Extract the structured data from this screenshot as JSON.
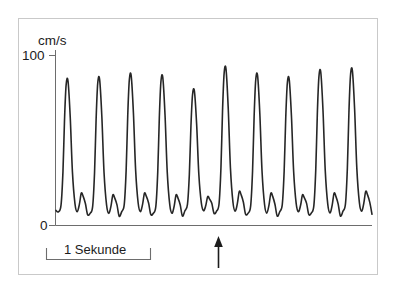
{
  "figure": {
    "name": "doppler-velocity-waveform",
    "background_color": "#ffffff",
    "frame_color": "#c9c9c9",
    "trace_color": "#262626",
    "axis_color": "#6d6d6d"
  },
  "labels": {
    "y_unit": "cm/s",
    "y_tick_top": "100",
    "y_tick_bottom": "0",
    "scale_bar": "1 Sekunde"
  },
  "chart_data": {
    "type": "line",
    "title": "",
    "subtitle": "",
    "xlabel": "",
    "ylabel": "cm/s",
    "grid": false,
    "legend": null,
    "ylim": [
      0,
      100
    ],
    "y_ticks": [
      0,
      100
    ],
    "y_tick_labels": [
      "0",
      "100"
    ],
    "x_unit": "seconds",
    "xlim": [
      0,
      10
    ],
    "x_ticks": [],
    "scale_bar": {
      "label": "1 Sekunde",
      "length_seconds": 1,
      "position": "below-axis-left"
    },
    "annotations": [
      {
        "type": "arrow",
        "name": "beat-marker-arrow",
        "direction": "up",
        "x_seconds": 5.1,
        "label": ""
      }
    ],
    "series": [
      {
        "name": "blood flow velocity",
        "units": "cm/s",
        "n_cycles": 10,
        "cycle_period_seconds": 1.0,
        "peak_systolic_velocities": [
          85,
          86,
          88,
          87,
          79,
          92,
          88,
          86,
          90,
          91
        ],
        "end_diastolic_velocities": [
          4,
          3,
          4,
          3,
          5,
          4,
          3,
          4,
          3,
          4
        ],
        "diastolic_bump_velocities": [
          19,
          18,
          19,
          18,
          17,
          20,
          19,
          18,
          19,
          20
        ],
        "waveform_morphology": "sharp systolic peak, dicrotic notch, small diastolic bump, deep trough",
        "x": [
          0.0,
          0.08,
          0.16,
          0.22,
          0.27,
          0.32,
          0.38,
          0.45,
          0.52,
          0.6,
          0.67,
          0.74,
          0.8,
          0.86,
          0.93,
          1.0
        ],
        "cycle_shape_normalized": [
          0.06,
          0.05,
          0.1,
          0.34,
          0.72,
          0.97,
          1.0,
          0.74,
          0.34,
          0.11,
          0.05,
          0.14,
          0.21,
          0.19,
          0.11,
          0.03
        ]
      }
    ]
  }
}
